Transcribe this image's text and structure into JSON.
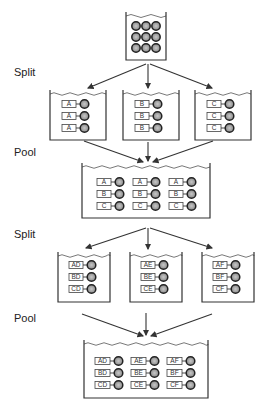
{
  "steps": [
    {
      "label": "Split"
    },
    {
      "label": "Pool"
    },
    {
      "label": "Split"
    },
    {
      "label": "Pool"
    }
  ],
  "stage1_split": {
    "beakers": [
      {
        "tags": [
          "A",
          "A",
          "A"
        ]
      },
      {
        "tags": [
          "B",
          "B",
          "B"
        ]
      },
      {
        "tags": [
          "C",
          "C",
          "C"
        ]
      }
    ]
  },
  "stage2_pool": {
    "rows": [
      [
        "A",
        "A",
        "A"
      ],
      [
        "B",
        "B",
        "B"
      ],
      [
        "C",
        "C",
        "C"
      ]
    ]
  },
  "stage3_split": {
    "beakers": [
      {
        "tags": [
          "AD",
          "BD",
          "CD"
        ]
      },
      {
        "tags": [
          "AE",
          "BE",
          "CE"
        ]
      },
      {
        "tags": [
          "AF",
          "BF",
          "CF"
        ]
      }
    ]
  },
  "stage4_pool": {
    "rows": [
      [
        "AD",
        "AE",
        "AF"
      ],
      [
        "BD",
        "BE",
        "BF"
      ],
      [
        "CD",
        "CE",
        "CF"
      ]
    ]
  },
  "colors": {
    "line": "#333333",
    "bead_fill": "#9a9a9a",
    "background": "#ffffff"
  }
}
